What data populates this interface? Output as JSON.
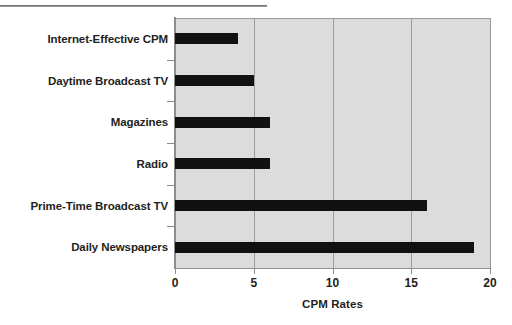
{
  "figure": {
    "background_color": "#ffffff",
    "plot_background_color": "#dcdcdc",
    "bar_color": "#111111",
    "axis_color": "#8d8d8d",
    "gridline_color": "#9d9d9d",
    "text_color": "#231f20",
    "top_rule": "decorative-horizontal-rule"
  },
  "chart_data": {
    "type": "bar",
    "orientation": "horizontal",
    "title": "",
    "subtitle": "",
    "xlabel": "CPM Rates",
    "ylabel": "",
    "categories": [
      "Daily Newspapers",
      "Prime-Time Broadcast TV",
      "Radio",
      "Magazines",
      "Daytime Broadcast TV",
      "Internet-Effective CPM"
    ],
    "values": [
      19,
      16,
      6,
      6,
      5,
      4
    ],
    "xlim": [
      0,
      20
    ],
    "xticks": [
      0,
      5,
      10,
      15,
      20
    ],
    "xtick_labels": [
      "0",
      "5",
      "10",
      "15",
      "20"
    ],
    "grid": "vertical",
    "legend": "none",
    "annotations": []
  },
  "axis": {
    "x_title": "CPM Rates",
    "ticks": [
      {
        "label": "0",
        "value": 0
      },
      {
        "label": "5",
        "value": 5
      },
      {
        "label": "10",
        "value": 10
      },
      {
        "label": "15",
        "value": 15
      },
      {
        "label": "20",
        "value": 20
      }
    ]
  },
  "bars": [
    {
      "label": "Internet-Effective CPM",
      "value": 4
    },
    {
      "label": "Daytime Broadcast TV",
      "value": 5
    },
    {
      "label": "Magazines",
      "value": 6
    },
    {
      "label": "Radio",
      "value": 6
    },
    {
      "label": "Prime-Time Broadcast TV",
      "value": 16
    },
    {
      "label": "Daily Newspapers",
      "value": 19
    }
  ]
}
